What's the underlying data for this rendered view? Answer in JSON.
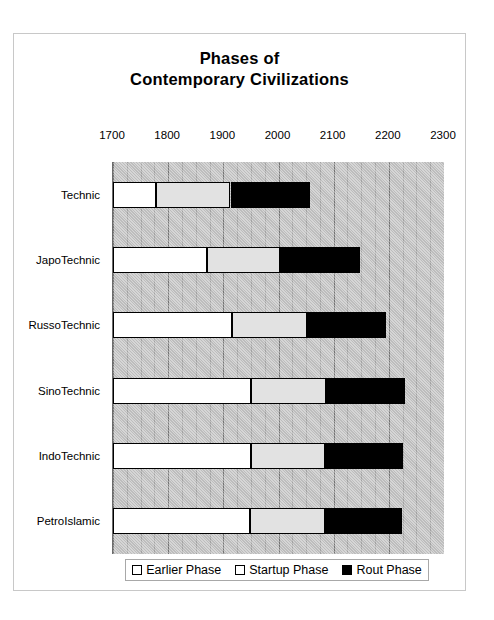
{
  "chart_data": {
    "type": "bar",
    "orientation": "horizontal",
    "stacked": true,
    "title": "Phases of Contemporary Civilizations",
    "title_lines": [
      "Phases of",
      "Contemporary Civilizations"
    ],
    "xlabel": "",
    "ylabel": "",
    "xlim": [
      1700,
      2300
    ],
    "xticks": [
      1700,
      1800,
      1900,
      2000,
      2100,
      2200,
      2300
    ],
    "xtick_labels": [
      "1700",
      "1800",
      "1900",
      "2000",
      "2100",
      "2200",
      "2300"
    ],
    "minor_tick_step": 25,
    "grid": true,
    "plot_background": "#c4c4c4",
    "categories": [
      "Technic",
      "JapoTechnic",
      "RussoTechnic",
      "SinoTechnic",
      "IndoTechnic",
      "PetroIslamic"
    ],
    "legend_position": "bottom",
    "series": [
      {
        "name": "Earlier Phase",
        "color": "#ffffff",
        "starts": [
          1700,
          1700,
          1700,
          1700,
          1700,
          1700
        ],
        "ends": [
          1778,
          1871,
          1915,
          1950,
          1950,
          1948
        ],
        "values": [
          78,
          171,
          215,
          250,
          250,
          248
        ]
      },
      {
        "name": "Startup Phase",
        "color": "#e2e2e2",
        "starts": [
          1778,
          1871,
          1915,
          1950,
          1950,
          1948
        ],
        "ends": [
          1913,
          2003,
          2052,
          2086,
          2084,
          2084
        ],
        "values": [
          135,
          132,
          137,
          136,
          134,
          136
        ]
      },
      {
        "name": "Rout Phase",
        "color": "#000000",
        "starts": [
          1913,
          2003,
          2052,
          2086,
          2084,
          2084
        ],
        "ends": [
          2058,
          2148,
          2195,
          2229,
          2225,
          2224
        ],
        "values": [
          145,
          145,
          143,
          143,
          141,
          140
        ]
      }
    ]
  },
  "legend": {
    "items": [
      {
        "label": "Earlier Phase",
        "swatch": "earlier"
      },
      {
        "label": "Startup Phase",
        "swatch": "startup"
      },
      {
        "label": "Rout Phase",
        "swatch": "rout"
      }
    ]
  }
}
